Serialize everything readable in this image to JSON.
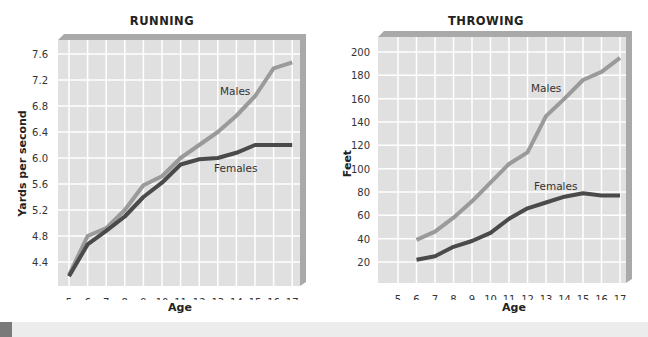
{
  "chart_data": [
    {
      "type": "line",
      "title": "RUNNING",
      "xlabel": "Age",
      "ylabel": "Yards per second",
      "x": [
        5,
        6,
        7,
        8,
        9,
        10,
        11,
        12,
        13,
        14,
        15,
        16,
        17
      ],
      "x_ticks": [
        "5",
        "6",
        "7",
        "8",
        "9",
        "10",
        "11",
        "12",
        "13",
        "14",
        "15",
        "16",
        "17"
      ],
      "y_ticks": [
        "4.4",
        "4.8",
        "5.2",
        "5.6",
        "6.0",
        "6.4",
        "6.8",
        "7.2",
        "7.6"
      ],
      "ylim": [
        4.0,
        7.8
      ],
      "grid": true,
      "legend": "inline labels",
      "series": [
        {
          "name": "Males",
          "values": [
            4.2,
            4.8,
            4.92,
            5.2,
            5.58,
            5.72,
            6.0,
            6.2,
            6.4,
            6.65,
            6.95,
            7.38,
            7.47
          ]
        },
        {
          "name": "Females",
          "values": [
            4.18,
            4.67,
            4.88,
            5.1,
            5.4,
            5.62,
            5.9,
            5.98,
            6.0,
            6.08,
            6.2,
            6.2,
            6.2
          ]
        }
      ],
      "annotations": [
        "Males",
        "Females"
      ]
    },
    {
      "type": "line",
      "title": "THROWING",
      "xlabel": "Age",
      "ylabel": "Feet",
      "x": [
        6,
        7,
        8,
        9,
        10,
        11,
        12,
        13,
        14,
        15,
        16,
        17
      ],
      "x_ticks": [
        "5",
        "6",
        "7",
        "8",
        "9",
        "10",
        "11",
        "12",
        "13",
        "14",
        "15",
        "16",
        "17"
      ],
      "y_ticks": [
        "20",
        "40",
        "60",
        "80",
        "100",
        "120",
        "140",
        "160",
        "180",
        "200"
      ],
      "ylim": [
        0,
        210
      ],
      "grid": true,
      "legend": "inline labels",
      "series": [
        {
          "name": "Males",
          "values": [
            39,
            46,
            58,
            72,
            88,
            104,
            114,
            145,
            160,
            176,
            183,
            195
          ]
        },
        {
          "name": "Females",
          "values": [
            22,
            25,
            33,
            38,
            45,
            57,
            66,
            71,
            76,
            79,
            77,
            77
          ]
        }
      ],
      "annotations": [
        "Males",
        "Females"
      ]
    }
  ],
  "colors": {
    "plot_bg": "#e0e0e0",
    "grid": "#ffffff",
    "frame_shadow": "#a9a9a9",
    "males_line": "#9a9a9a",
    "females_line": "#4a4a4a"
  }
}
